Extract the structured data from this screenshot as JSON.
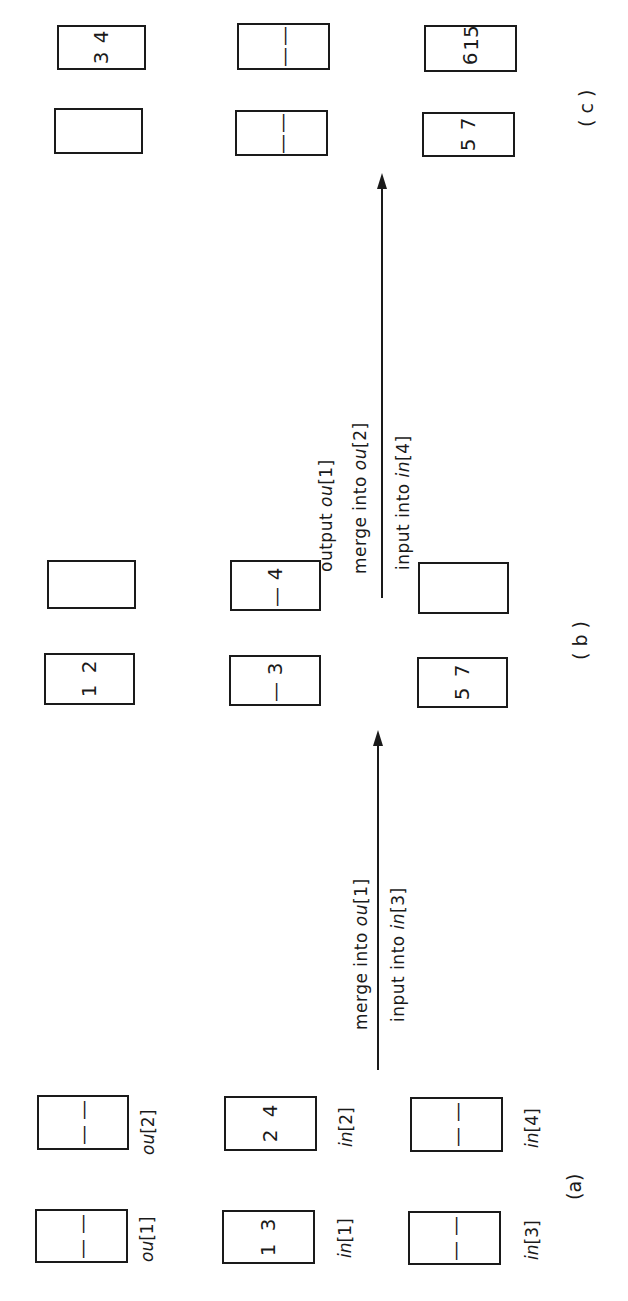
{
  "figure": {
    "orientation": "rotated 90 degrees counter-clockwise",
    "panels": [
      {
        "id": "a",
        "caption": "(a)",
        "buffers": {
          "ou1": {
            "label_prefix": "ou",
            "label_index": "[1]",
            "values": [
              "—",
              "—"
            ]
          },
          "ou2": {
            "label_prefix": "ou",
            "label_index": "[2]",
            "values": [
              "—",
              "—"
            ]
          },
          "in1": {
            "label_prefix": "in",
            "label_index": "[1]",
            "values": [
              "1",
              "3"
            ]
          },
          "in2": {
            "label_prefix": "in",
            "label_index": "[2]",
            "values": [
              "2",
              "4"
            ]
          },
          "in3": {
            "label_prefix": "in",
            "label_index": "[3]",
            "values": [
              "—",
              "—"
            ]
          },
          "in4": {
            "label_prefix": "in",
            "label_index": "[4]",
            "values": [
              "—",
              "—"
            ]
          }
        }
      },
      {
        "id": "b",
        "caption": "( b )",
        "buffers": {
          "ou1": {
            "values": [
              "1",
              "2"
            ]
          },
          "ou2": {
            "values": [
              "",
              ""
            ]
          },
          "in1": {
            "values": [
              "—",
              "3"
            ]
          },
          "in2": {
            "values": [
              "—",
              "4"
            ]
          },
          "in3": {
            "values": [
              "5",
              "7"
            ]
          },
          "in4": {
            "values": [
              "",
              ""
            ]
          }
        }
      },
      {
        "id": "c",
        "caption": "( c )",
        "buffers": {
          "ou1": {
            "values": [
              "",
              ""
            ]
          },
          "ou2": {
            "values": [
              "3",
              "4"
            ]
          },
          "in1": {
            "values": [
              "—",
              "—"
            ]
          },
          "in2": {
            "values": [
              "—",
              "—"
            ]
          },
          "in3": {
            "values": [
              "5",
              "7"
            ]
          },
          "in4": {
            "values": [
              "6",
              "15"
            ]
          }
        }
      }
    ],
    "transitions": [
      {
        "from": "a",
        "to": "b",
        "above_line": [
          {
            "text": "merge into ",
            "var": "ou",
            "index": "[1]"
          }
        ],
        "below_line": [
          {
            "text": "input into ",
            "var": "in",
            "index": "[3]"
          }
        ]
      },
      {
        "from": "b",
        "to": "c",
        "above_line": [
          {
            "text": "output ",
            "var": "ou",
            "index": "[1]"
          },
          {
            "text": "merge into ",
            "var": "ou",
            "index": "[2]"
          }
        ],
        "below_line": [
          {
            "text": "input into ",
            "var": "in",
            "index": "[4]"
          }
        ]
      }
    ]
  }
}
